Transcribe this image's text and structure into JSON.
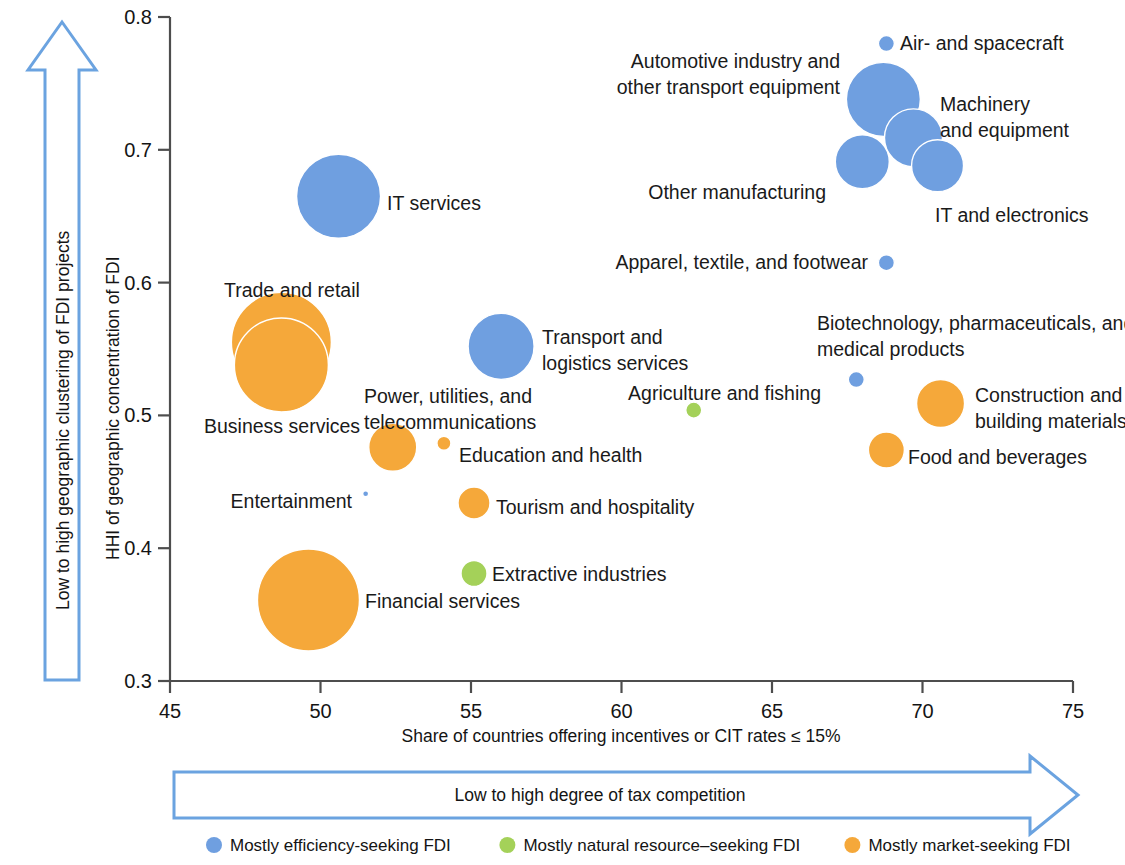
{
  "chart_data": {
    "type": "scatter",
    "title": "",
    "xlabel": "Share of countries offering incentives or CIT rates ≤ 15%",
    "ylabel": "HHI of geographic concentration of FDI",
    "xlim": [
      45,
      75
    ],
    "ylim": [
      0.3,
      0.8
    ],
    "xticks": [
      "45",
      "50",
      "55",
      "60",
      "65",
      "70",
      "75"
    ],
    "yticks": [
      "0.3",
      "0.4",
      "0.5",
      "0.6",
      "0.7",
      "0.8"
    ],
    "grid": false,
    "legend_position": "bottom",
    "x_arrow_label": "Low to high degree of tax competition",
    "y_arrow_label": "Low to high geographic clustering of FDI projects",
    "series": [
      {
        "name": "Mostly efficiency-seeking FDI",
        "color": "#6f9fe0"
      },
      {
        "name": "Mostly natural resource–seeking FDI",
        "color": "#a4d159"
      },
      {
        "name": "Mostly market-seeking FDI",
        "color": "#f5a83a"
      }
    ],
    "points": [
      {
        "label": "Air- and spacecraft",
        "x": 68.8,
        "y": 0.78,
        "size": 8,
        "group": "efficiency",
        "color": "#6f9fe0",
        "label_x": 900,
        "label_y": 50,
        "label_anchor": "start",
        "lines": [
          "Air- and spacecraft"
        ]
      },
      {
        "label": "Automotive industry and other transport equipment",
        "x": 68.7,
        "y": 0.738,
        "size": 37,
        "group": "efficiency",
        "color": "#6f9fe0",
        "label_x": 840,
        "label_y": 68,
        "label_anchor": "end",
        "lines": [
          "Automotive industry and",
          "other transport equipment"
        ]
      },
      {
        "label": "Machinery and equipment",
        "x": 69.7,
        "y": 0.709,
        "size": 29,
        "group": "efficiency",
        "color": "#6f9fe0",
        "label_x": 940,
        "label_y": 111,
        "label_anchor": "start",
        "lines": [
          "Machinery",
          "and equipment"
        ]
      },
      {
        "label": "Other manufacturing",
        "x": 68.0,
        "y": 0.691,
        "size": 27,
        "group": "efficiency",
        "color": "#6f9fe0",
        "label_x": 826,
        "label_y": 199,
        "label_anchor": "end",
        "lines": [
          "Other manufacturing"
        ]
      },
      {
        "label": "IT and electronics",
        "x": 70.5,
        "y": 0.688,
        "size": 26,
        "group": "efficiency",
        "color": "#6f9fe0",
        "label_x": 935,
        "label_y": 222,
        "label_anchor": "start",
        "lines": [
          "IT and electronics"
        ]
      },
      {
        "label": "IT services",
        "x": 50.6,
        "y": 0.665,
        "size": 42,
        "group": "efficiency",
        "color": "#6f9fe0",
        "label_x": 387,
        "label_y": 210,
        "label_anchor": "start",
        "lines": [
          "IT services"
        ]
      },
      {
        "label": "Apparel, textile, and footwear",
        "x": 68.8,
        "y": 0.615,
        "size": 8,
        "group": "efficiency",
        "color": "#6f9fe0",
        "label_x": 868,
        "label_y": 269,
        "label_anchor": "end",
        "lines": [
          "Apparel, textile,  and footwear"
        ]
      },
      {
        "label": "Trade and retail",
        "x": 48.7,
        "y": 0.555,
        "size": 50,
        "group": "market",
        "color": "#f5a83a",
        "label_x": 224,
        "label_y": 297,
        "label_anchor": "start",
        "lines": [
          "Trade and retail"
        ]
      },
      {
        "label": "Business services",
        "x": 48.7,
        "y": 0.538,
        "size": 47,
        "group": "market",
        "color": "#f5a83a",
        "label_x": 204,
        "label_y": 433,
        "label_anchor": "start",
        "lines": [
          "Business services"
        ]
      },
      {
        "label": "Transport and logistics services",
        "x": 56.0,
        "y": 0.552,
        "size": 33,
        "group": "efficiency",
        "color": "#6f9fe0",
        "label_x": 542,
        "label_y": 344,
        "label_anchor": "start",
        "lines": [
          "Transport and",
          "logistics services"
        ]
      },
      {
        "label": "Biotechnology, pharmaceuticals, and medical products",
        "x": 67.8,
        "y": 0.527,
        "size": 8,
        "group": "efficiency",
        "color": "#6f9fe0",
        "label_x": 817,
        "label_y": 330,
        "label_anchor": "start",
        "lines": [
          "Biotechnology, pharmaceuticals, and",
          "medical products"
        ]
      },
      {
        "label": "Construction and building materials",
        "x": 70.6,
        "y": 0.509,
        "size": 24,
        "group": "market",
        "color": "#f5a83a",
        "label_x": 975,
        "label_y": 402,
        "label_anchor": "start",
        "lines": [
          "Construction and",
          "building materials"
        ]
      },
      {
        "label": "Agriculture and fishing",
        "x": 62.4,
        "y": 0.504,
        "size": 8,
        "group": "natural",
        "color": "#a4d159",
        "label_x": 821,
        "label_y": 400,
        "label_anchor": "end",
        "lines": [
          "Agriculture and fishing"
        ]
      },
      {
        "label": "Power, utilities, and telecommunications",
        "x": 52.4,
        "y": 0.476,
        "size": 24,
        "group": "market",
        "color": "#f5a83a",
        "label_x": 364,
        "label_y": 403,
        "label_anchor": "start",
        "lines": [
          "Power, utilities, and",
          "telecommunications"
        ]
      },
      {
        "label": "Food and beverages",
        "x": 68.8,
        "y": 0.474,
        "size": 18,
        "group": "market",
        "color": "#f5a83a",
        "label_x": 908,
        "label_y": 464,
        "label_anchor": "start",
        "lines": [
          "Food and beverages"
        ]
      },
      {
        "label": "Education and health",
        "x": 54.1,
        "y": 0.479,
        "size": 7,
        "group": "market",
        "color": "#f5a83a",
        "label_x": 459,
        "label_y": 462,
        "label_anchor": "start",
        "lines": [
          "Education and health"
        ]
      },
      {
        "label": "Entertainment",
        "x": 51.5,
        "y": 0.441,
        "size": 3,
        "group": "efficiency",
        "color": "#6f9fe0",
        "label_x": 352,
        "label_y": 508,
        "label_anchor": "end",
        "lines": [
          "Entertainment"
        ]
      },
      {
        "label": "Tourism and hospitality",
        "x": 55.1,
        "y": 0.434,
        "size": 16,
        "group": "market",
        "color": "#f5a83a",
        "label_x": 496,
        "label_y": 514,
        "label_anchor": "start",
        "lines": [
          "Tourism and hospitality"
        ]
      },
      {
        "label": "Extractive industries",
        "x": 55.1,
        "y": 0.381,
        "size": 13,
        "group": "natural",
        "color": "#a4d159",
        "label_x": 492,
        "label_y": 581,
        "label_anchor": "start",
        "lines": [
          "Extractive industries"
        ]
      },
      {
        "label": "Financial services",
        "x": 49.6,
        "y": 0.361,
        "size": 51,
        "group": "market",
        "color": "#f5a83a",
        "label_x": 365,
        "label_y": 608,
        "label_anchor": "start",
        "lines": [
          "Financial services"
        ]
      }
    ]
  },
  "legend": {
    "items": [
      {
        "label": "Mostly efficiency-seeking FDI",
        "color": "#6f9fe0"
      },
      {
        "label": "Mostly natural resource–seeking FDI",
        "color": "#a4d159"
      },
      {
        "label": "Mostly market-seeking FDI",
        "color": "#f5a83a"
      }
    ]
  },
  "colors": {
    "efficiency": "#6f9fe0",
    "natural": "#a4d159",
    "market": "#f5a83a",
    "arrow_stroke": "#6ba3e0",
    "axis": "#4d4d4d"
  }
}
